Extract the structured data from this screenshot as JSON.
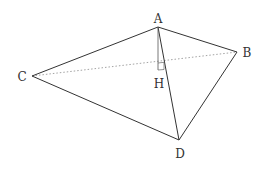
{
  "diagram": {
    "type": "tetrahedron",
    "colors": {
      "edge": "#333333",
      "hidden_edge": "#888888",
      "label": "#333333",
      "background": "#ffffff"
    },
    "points": {
      "A": {
        "label": "A",
        "x": 158,
        "y": 27,
        "label_x": 158,
        "label_y": 23
      },
      "B": {
        "label": "B",
        "x": 237,
        "y": 52,
        "label_x": 246,
        "label_y": 57
      },
      "C": {
        "label": "C",
        "x": 32,
        "y": 76,
        "label_x": 22,
        "label_y": 81
      },
      "D": {
        "label": "D",
        "x": 179,
        "y": 140,
        "label_x": 180,
        "label_y": 158
      },
      "H": {
        "label": "H",
        "x": 158,
        "y": 64,
        "label_x": 158,
        "label_y": 88
      }
    },
    "edges": [
      {
        "from": "A",
        "to": "C",
        "style": "solid"
      },
      {
        "from": "A",
        "to": "B",
        "style": "solid"
      },
      {
        "from": "C",
        "to": "D",
        "style": "solid"
      },
      {
        "from": "B",
        "to": "D",
        "style": "solid"
      },
      {
        "from": "A",
        "to": "D",
        "style": "solid"
      },
      {
        "from": "C",
        "to": "B",
        "style": "dotted"
      },
      {
        "from": "A",
        "to": "H",
        "style": "thin"
      }
    ],
    "right_angle_at": "H"
  }
}
